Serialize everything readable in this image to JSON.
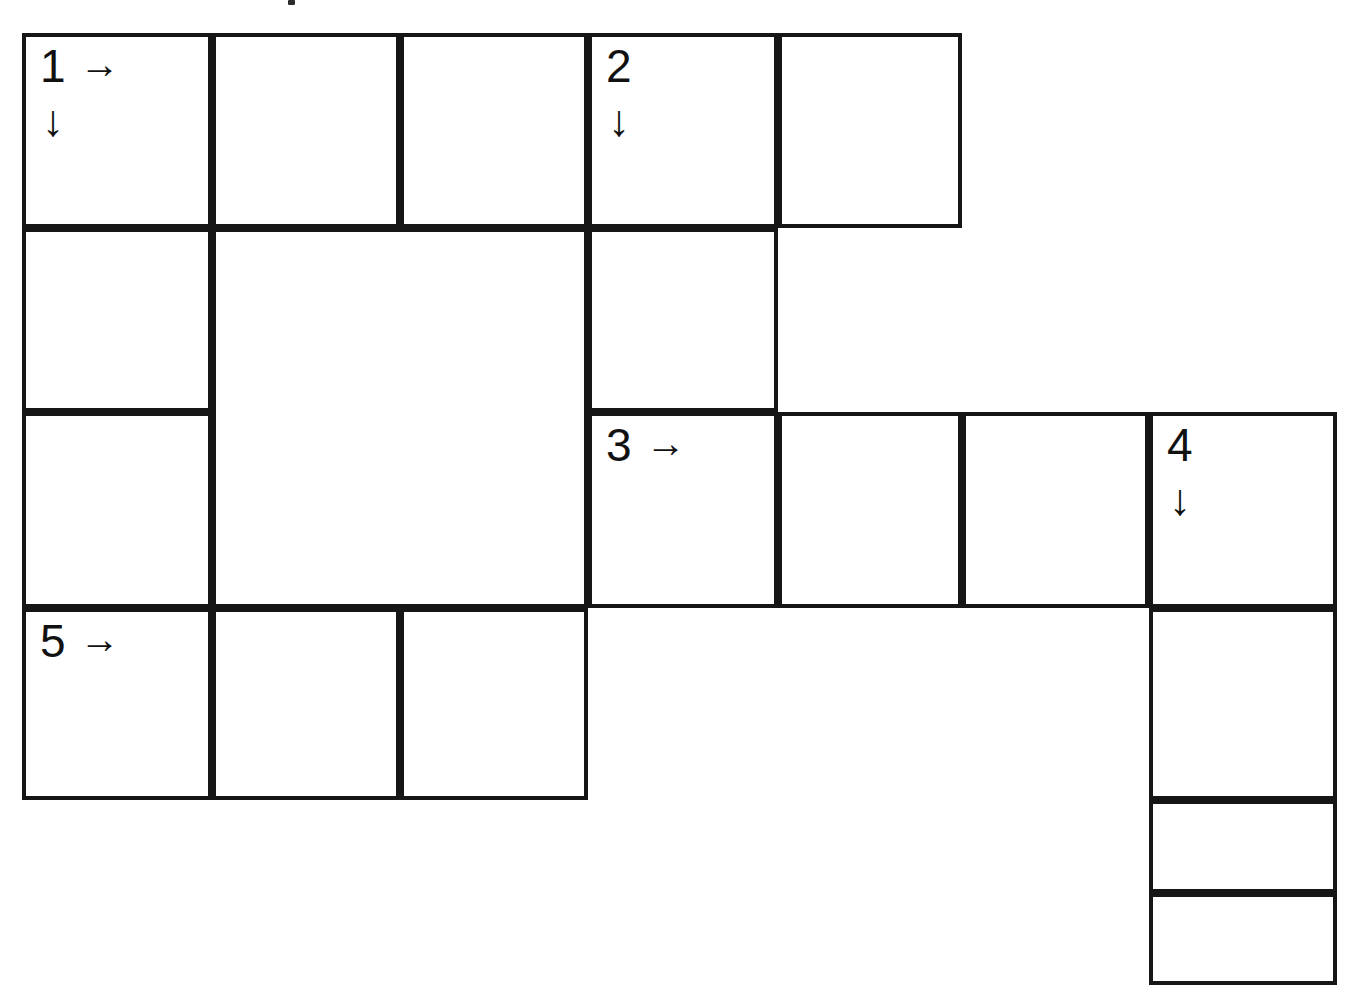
{
  "puzzle": {
    "type": "arrow-word-crossword-grid",
    "background_color": "#ffffff",
    "line_color": "#161616",
    "grid_origin": {
      "x": 22,
      "y": 33
    },
    "column_edges": [
      22,
      212,
      400,
      588,
      778,
      962,
      1149,
      1337
    ],
    "row_edges": [
      33,
      228,
      412,
      608,
      800,
      893,
      985
    ],
    "cells": [
      {
        "id": "cell-r1c1",
        "row": 1,
        "col": 1,
        "x": 22,
        "y": 33,
        "w": 190,
        "h": 195,
        "number": "1",
        "across_arrow": "→",
        "down_arrow": "↓",
        "letter": ""
      },
      {
        "id": "cell-r1c2",
        "row": 1,
        "col": 2,
        "x": 212,
        "y": 33,
        "w": 188,
        "h": 195,
        "number": "",
        "across_arrow": "",
        "down_arrow": "",
        "letter": ""
      },
      {
        "id": "cell-r1c3",
        "row": 1,
        "col": 3,
        "x": 400,
        "y": 33,
        "w": 188,
        "h": 195,
        "number": "",
        "across_arrow": "",
        "down_arrow": "",
        "letter": ""
      },
      {
        "id": "cell-r1c4",
        "row": 1,
        "col": 4,
        "x": 588,
        "y": 33,
        "w": 190,
        "h": 195,
        "number": "2",
        "across_arrow": "",
        "down_arrow": "↓",
        "letter": ""
      },
      {
        "id": "cell-r1c5",
        "row": 1,
        "col": 5,
        "x": 778,
        "y": 33,
        "w": 184,
        "h": 195,
        "number": "",
        "across_arrow": "",
        "down_arrow": "",
        "letter": ""
      },
      {
        "id": "cell-r2c1",
        "row": 2,
        "col": 1,
        "x": 22,
        "y": 228,
        "w": 190,
        "h": 184,
        "number": "",
        "across_arrow": "",
        "down_arrow": "",
        "letter": ""
      },
      {
        "id": "cell-r2c2-merged",
        "row": 2,
        "col": 2,
        "x": 212,
        "y": 228,
        "w": 376,
        "h": 380,
        "number": "",
        "across_arrow": "",
        "down_arrow": "",
        "letter": ""
      },
      {
        "id": "cell-r2c4",
        "row": 2,
        "col": 4,
        "x": 588,
        "y": 228,
        "w": 190,
        "h": 184,
        "number": "",
        "across_arrow": "",
        "down_arrow": "",
        "letter": ""
      },
      {
        "id": "cell-r3c1",
        "row": 3,
        "col": 1,
        "x": 22,
        "y": 412,
        "w": 190,
        "h": 196,
        "number": "",
        "across_arrow": "",
        "down_arrow": "",
        "letter": ""
      },
      {
        "id": "cell-r3c4",
        "row": 3,
        "col": 4,
        "x": 588,
        "y": 412,
        "w": 190,
        "h": 196,
        "number": "3",
        "across_arrow": "→",
        "down_arrow": "",
        "letter": ""
      },
      {
        "id": "cell-r3c5",
        "row": 3,
        "col": 5,
        "x": 778,
        "y": 412,
        "w": 184,
        "h": 196,
        "number": "",
        "across_arrow": "",
        "down_arrow": "",
        "letter": ""
      },
      {
        "id": "cell-r3c6",
        "row": 3,
        "col": 6,
        "x": 962,
        "y": 412,
        "w": 187,
        "h": 196,
        "number": "",
        "across_arrow": "",
        "down_arrow": "",
        "letter": ""
      },
      {
        "id": "cell-r3c7",
        "row": 3,
        "col": 7,
        "x": 1149,
        "y": 412,
        "w": 188,
        "h": 196,
        "number": "4",
        "across_arrow": "",
        "down_arrow": "↓",
        "letter": ""
      },
      {
        "id": "cell-r4c1",
        "row": 4,
        "col": 1,
        "x": 22,
        "y": 608,
        "w": 190,
        "h": 192,
        "number": "5",
        "across_arrow": "→",
        "down_arrow": "",
        "letter": ""
      },
      {
        "id": "cell-r4c2",
        "row": 4,
        "col": 2,
        "x": 212,
        "y": 608,
        "w": 188,
        "h": 192,
        "number": "",
        "across_arrow": "",
        "down_arrow": "",
        "letter": ""
      },
      {
        "id": "cell-r4c3",
        "row": 4,
        "col": 3,
        "x": 400,
        "y": 608,
        "w": 188,
        "h": 192,
        "number": "",
        "across_arrow": "",
        "down_arrow": "",
        "letter": ""
      },
      {
        "id": "cell-r4c7",
        "row": 4,
        "col": 7,
        "x": 1149,
        "y": 608,
        "w": 188,
        "h": 192,
        "number": "",
        "across_arrow": "",
        "down_arrow": "",
        "letter": ""
      },
      {
        "id": "cell-r5c7",
        "row": 5,
        "col": 7,
        "x": 1149,
        "y": 800,
        "w": 188,
        "h": 93,
        "number": "",
        "across_arrow": "",
        "down_arrow": "",
        "letter": ""
      },
      {
        "id": "cell-r6c7",
        "row": 6,
        "col": 7,
        "x": 1149,
        "y": 893,
        "w": 188,
        "h": 92,
        "number": "",
        "across_arrow": "",
        "down_arrow": "",
        "letter": ""
      }
    ],
    "artifacts": [
      {
        "id": "speck-top",
        "x": 288,
        "y": 0,
        "w": 7,
        "h": 5
      }
    ]
  }
}
